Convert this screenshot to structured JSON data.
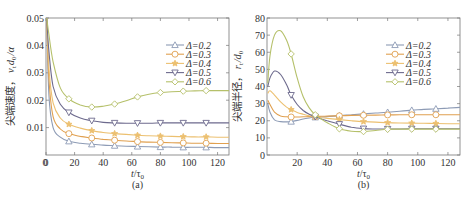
{
  "chart_data": [
    {
      "type": "line",
      "panel_label": "(a)",
      "title": "",
      "xlabel": "t/τ0",
      "ylabel": "尖端速度， v_t d_0 / α",
      "xlim": [
        0,
        128
      ],
      "ylim": [
        0,
        0.05
      ],
      "xticks": [
        0,
        20,
        40,
        60,
        80,
        100,
        120
      ],
      "yticks": [
        0.01,
        0.02,
        0.03,
        0.04,
        0.05
      ],
      "ytick_labels": [
        "0.01",
        "0.02",
        "0.03",
        "0.04",
        "0.05"
      ],
      "grid": false,
      "legend_position": "upper right",
      "x": [
        0.5,
        2,
        5,
        10,
        16,
        24,
        32,
        40,
        48,
        56,
        64,
        72,
        80,
        88,
        96,
        104,
        112,
        120,
        128
      ],
      "marker_x": [
        16,
        32,
        48,
        64,
        80,
        96,
        112
      ],
      "series": [
        {
          "name": "Δ=0.2",
          "color": "#8d9bb5",
          "marker": "triangle-up",
          "values": [
            0.05,
            0.022,
            0.01,
            0.0065,
            0.005,
            0.0043,
            0.0039,
            0.0036,
            0.0034,
            0.0032,
            0.0031,
            0.003,
            0.0029,
            0.0029,
            0.0028,
            0.0028,
            0.0028,
            0.0027,
            0.0027
          ]
        },
        {
          "name": "Δ=0.3",
          "color": "#e0a050",
          "marker": "circle",
          "values": [
            0.05,
            0.028,
            0.014,
            0.0095,
            0.0078,
            0.0068,
            0.0062,
            0.0057,
            0.0054,
            0.0051,
            0.0049,
            0.0047,
            0.0046,
            0.0045,
            0.0044,
            0.0043,
            0.0043,
            0.0042,
            0.0042
          ]
        },
        {
          "name": "Δ=0.4",
          "color": "#ecc070",
          "marker": "star",
          "values": [
            0.05,
            0.032,
            0.019,
            0.0135,
            0.0112,
            0.0098,
            0.0089,
            0.0082,
            0.0078,
            0.0075,
            0.0072,
            0.007,
            0.0069,
            0.0068,
            0.0067,
            0.0066,
            0.0066,
            0.0065,
            0.0065
          ]
        },
        {
          "name": "Δ=0.5",
          "color": "#6d6a8d",
          "marker": "triangle-down",
          "values": [
            0.05,
            0.038,
            0.025,
            0.0185,
            0.0155,
            0.0135,
            0.0125,
            0.0119,
            0.0117,
            0.0116,
            0.0116,
            0.0116,
            0.0117,
            0.0117,
            0.0117,
            0.0117,
            0.0117,
            0.0117,
            0.0117
          ]
        },
        {
          "name": "Δ=0.6",
          "color": "#b5c06a",
          "marker": "diamond",
          "values": [
            0.05,
            0.044,
            0.034,
            0.0245,
            0.0205,
            0.0183,
            0.0175,
            0.0178,
            0.0186,
            0.0198,
            0.0212,
            0.0222,
            0.0228,
            0.0231,
            0.0233,
            0.0234,
            0.0235,
            0.0235,
            0.0235
          ]
        }
      ]
    },
    {
      "type": "line",
      "panel_label": "(b)",
      "title": "",
      "xlabel": "t/τ0",
      "ylabel": "尖端半径， r_t / d_0",
      "xlim": [
        0,
        128
      ],
      "ylim": [
        0,
        80
      ],
      "xticks": [
        20,
        40,
        60,
        80,
        100,
        120
      ],
      "yticks": [
        0,
        10,
        20,
        30,
        40,
        50,
        60,
        70,
        80
      ],
      "ytick_labels": [
        "0",
        "10",
        "20",
        "30",
        "40",
        "50",
        "60",
        "70",
        "80"
      ],
      "grid": false,
      "legend_position": "upper right",
      "x": [
        0.5,
        2,
        5,
        9,
        13,
        16,
        20,
        24,
        28,
        32,
        36,
        40,
        48,
        56,
        64,
        72,
        80,
        88,
        96,
        104,
        112,
        120,
        128
      ],
      "marker_x": [
        16,
        32,
        48,
        64,
        80,
        96,
        112
      ],
      "series": [
        {
          "name": "Δ=0.2",
          "color": "#8d9bb5",
          "marker": "triangle-up",
          "values": [
            30,
            25,
            20.5,
            19.5,
            19.3,
            19.5,
            20.2,
            21,
            21.6,
            22,
            22.2,
            22.4,
            23,
            23.5,
            24,
            24.5,
            25,
            25.6,
            26.2,
            26.6,
            27,
            27.4,
            27.8
          ]
        },
        {
          "name": "Δ=0.3",
          "color": "#e0a050",
          "marker": "circle",
          "values": [
            32,
            29.5,
            25,
            22.8,
            22.3,
            22.2,
            22.2,
            22.3,
            22.4,
            22.5,
            22.6,
            22.7,
            22.9,
            23.1,
            23.2,
            23.3,
            23.4,
            23.5,
            23.5,
            23.5,
            23.5,
            23.5,
            23.5
          ]
        },
        {
          "name": "Δ=0.4",
          "color": "#ecc070",
          "marker": "star",
          "values": [
            36,
            37.5,
            35,
            31,
            28,
            26.5,
            24.8,
            23.8,
            22.9,
            22.3,
            21.8,
            21.4,
            20.7,
            20.0,
            19.5,
            19.2,
            18.9,
            18.7,
            18.6,
            18.5,
            18.4,
            18.3,
            18.3
          ]
        },
        {
          "name": "Δ=0.5",
          "color": "#6d6a8d",
          "marker": "triangle-down",
          "values": [
            40,
            45,
            49,
            47,
            41,
            35,
            29.5,
            26,
            23.8,
            22.3,
            21,
            20,
            18,
            16.2,
            15.4,
            15.2,
            15.2,
            15.2,
            15.3,
            15.3,
            15.3,
            15.3,
            15.3
          ]
        },
        {
          "name": "Δ=0.6",
          "color": "#b5c06a",
          "marker": "diamond",
          "values": [
            42,
            58,
            70,
            72.5,
            67,
            59,
            45,
            34,
            27.5,
            23.5,
            21,
            18.8,
            15.3,
            13.9,
            13.7,
            14.3,
            15,
            15.1,
            15.1,
            15.1,
            15.1,
            15.1,
            15.1
          ]
        }
      ]
    }
  ],
  "panels": {
    "a": {
      "label": "(a)",
      "xlabel_main": "t",
      "xlabel_div": "/τ",
      "xlabel_sub": "0",
      "ylabel_cn": "尖端速度，",
      "ylabel_var": "v",
      "ylabel_var_sub": "t",
      "ylabel_rest": "d",
      "ylabel_rest_sub": "0",
      "ylabel_tail": "/α"
    },
    "b": {
      "label": "(b)",
      "xlabel_main": "t",
      "xlabel_div": "/τ",
      "xlabel_sub": "0",
      "ylabel_cn": "尖端半径，",
      "ylabel_var": "r",
      "ylabel_var_sub": "t",
      "ylabel_rest": "/d",
      "ylabel_rest_sub": "0",
      "ylabel_tail": ""
    }
  }
}
